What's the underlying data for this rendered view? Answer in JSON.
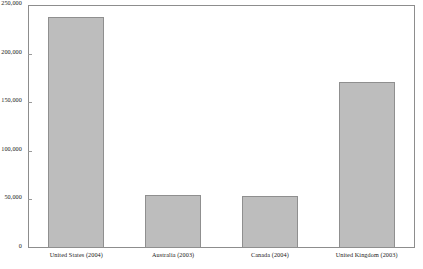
{
  "chart_data": {
    "type": "bar",
    "title": "",
    "subtitle": "",
    "xlabel": "",
    "ylabel": "",
    "categories": [
      "United States (2004)",
      "Australia (2003)",
      "Canada (2004)",
      "United Kingdom (2003)"
    ],
    "values": [
      237500,
      54500,
      53500,
      170500
    ],
    "ylim": [
      0,
      250000
    ],
    "yticks": [
      0,
      50000,
      100000,
      150000,
      200000,
      250000
    ],
    "ytick_labels": [
      "0",
      "50,000",
      "100,000",
      "150,000",
      "200,000",
      "250,000"
    ],
    "grid": false,
    "legend": null,
    "bar_color": "#bdbdbd",
    "bar_border_color": "#8f8f8f",
    "frame_color": "#8d8d8d",
    "background_color": "#ffffff"
  }
}
